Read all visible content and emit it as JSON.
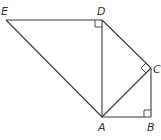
{
  "diagram": {
    "type": "geometry",
    "points": {
      "E": {
        "label": "E",
        "x": 6,
        "y": 20
      },
      "D": {
        "label": "D",
        "x": 102,
        "y": 20
      },
      "C": {
        "label": "C",
        "x": 151,
        "y": 68
      },
      "A": {
        "label": "A",
        "x": 102,
        "y": 117
      },
      "B": {
        "label": "B",
        "x": 151,
        "y": 117
      }
    },
    "segments": [
      "ED",
      "EA",
      "DA",
      "DC",
      "CA",
      "CB",
      "AB"
    ],
    "right_angles": [
      "EDA",
      "DCA",
      "ABC"
    ],
    "labels": {
      "E": "E",
      "D": "D",
      "C": "C",
      "A": "A",
      "B": "B"
    },
    "line_color": "#3a3a3a"
  }
}
